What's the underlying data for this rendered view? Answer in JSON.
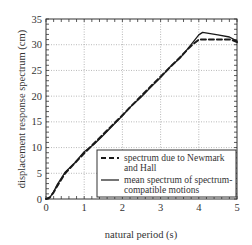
{
  "chart_data": {
    "type": "line",
    "title": "",
    "xlabel": "natural period (s)",
    "ylabel": "displacement response spectrum (cm)",
    "xlim": [
      0,
      5
    ],
    "ylim": [
      0,
      35
    ],
    "x_ticks": [
      "0",
      "1",
      "2",
      "3",
      "4",
      "5"
    ],
    "y_ticks": [
      "0",
      "5",
      "10",
      "15",
      "20",
      "25",
      "30",
      "35"
    ],
    "grid": true,
    "legend_position": "lower right",
    "series": [
      {
        "name": "spectrum due to Newmark and Hall",
        "style": "dashed",
        "x": [
          0,
          0.1,
          0.2,
          0.3,
          0.5,
          1.0,
          1.5,
          2.0,
          2.5,
          3.0,
          3.5,
          3.8,
          4.0,
          4.85,
          5.0
        ],
        "values": [
          0,
          0.3,
          1.3,
          2.6,
          5.0,
          8.9,
          12.6,
          16.3,
          20.1,
          23.8,
          27.5,
          29.8,
          31.0,
          31.0,
          30.5
        ]
      },
      {
        "name": "mean spectrum of spectrum-compatible motions",
        "style": "solid",
        "x": [
          0,
          0.1,
          0.2,
          0.3,
          0.5,
          0.75,
          1.0,
          1.25,
          1.5,
          1.75,
          2.0,
          2.25,
          2.5,
          2.75,
          3.0,
          3.25,
          3.5,
          3.75,
          4.0,
          4.1,
          4.5,
          4.8,
          5.0
        ],
        "values": [
          0,
          0.3,
          1.4,
          2.9,
          5.2,
          7.0,
          9.2,
          10.6,
          12.4,
          14.3,
          16.2,
          18.2,
          19.9,
          21.8,
          23.6,
          25.7,
          27.3,
          29.6,
          31.9,
          32.4,
          31.9,
          31.5,
          30.7
        ]
      }
    ]
  },
  "legend": {
    "items": [
      {
        "line1": "spectrum due to Newmark",
        "line2": "and Hall"
      },
      {
        "line1": "mean spectrum of spectrum-",
        "line2": "compatible motions"
      }
    ]
  },
  "colors": {
    "line": "#1a1a1a",
    "grid": "#9a9a9a",
    "axis": "#333333"
  }
}
